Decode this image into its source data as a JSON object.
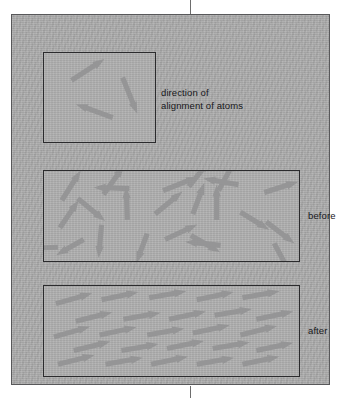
{
  "figure": {
    "panel_background": "#adadad",
    "arrow_color": "#959596",
    "border_color": "#2b2b2d"
  },
  "labels": {
    "key": "direction of\nalignment of atoms",
    "before": "before",
    "after": "after"
  },
  "chart_data": {
    "type": "diagram",
    "panels": [
      {
        "name": "key",
        "label": "direction of\nalignment of atoms",
        "arrow_count": 3,
        "arrows": [
          {
            "x": 28,
            "y": 28,
            "angle": -33,
            "length": 40
          },
          {
            "x": 80,
            "y": 25,
            "angle": 68,
            "length": 40
          },
          {
            "x": 70,
            "y": 66,
            "angle": 200,
            "length": 40
          }
        ]
      },
      {
        "name": "before",
        "label": "before",
        "description": "randomly oriented atomic magnets",
        "arrow_count": 24,
        "arrows": [
          {
            "x": 18,
            "y": 30,
            "angle": -58,
            "length": 36
          },
          {
            "x": 16,
            "y": 58,
            "angle": -56,
            "length": 34
          },
          {
            "x": 34,
            "y": 28,
            "angle": 40,
            "length": 36
          },
          {
            "x": 60,
            "y": 24,
            "angle": -55,
            "length": 36
          },
          {
            "x": 58,
            "y": 55,
            "angle": 95,
            "length": 34
          },
          {
            "x": 86,
            "y": 18,
            "angle": 182,
            "length": 36
          },
          {
            "x": 84,
            "y": 50,
            "angle": -92,
            "length": 34
          },
          {
            "x": 14,
            "y": 78,
            "angle": 178,
            "length": 36
          },
          {
            "x": 112,
            "y": 44,
            "angle": -40,
            "length": 36
          },
          {
            "x": 120,
            "y": 20,
            "angle": -22,
            "length": 38
          },
          {
            "x": 122,
            "y": 70,
            "angle": -25,
            "length": 36
          },
          {
            "x": 146,
            "y": 16,
            "angle": -52,
            "length": 34
          },
          {
            "x": 150,
            "y": 44,
            "angle": -70,
            "length": 34
          },
          {
            "x": 148,
            "y": 66,
            "angle": 30,
            "length": 34
          },
          {
            "x": 176,
            "y": 20,
            "angle": -62,
            "length": 36
          },
          {
            "x": 174,
            "y": 50,
            "angle": -90,
            "length": 36
          },
          {
            "x": 196,
            "y": 14,
            "angle": 190,
            "length": 36
          },
          {
            "x": 198,
            "y": 42,
            "angle": 32,
            "length": 34
          },
          {
            "x": 178,
            "y": 76,
            "angle": 186,
            "length": 36
          },
          {
            "x": 222,
            "y": 22,
            "angle": -18,
            "length": 36
          },
          {
            "x": 224,
            "y": 52,
            "angle": 38,
            "length": 36
          },
          {
            "x": 232,
            "y": 74,
            "angle": 62,
            "length": 34
          },
          {
            "x": 104,
            "y": 64,
            "angle": 110,
            "length": 32
          },
          {
            "x": 40,
            "y": 70,
            "angle": 150,
            "length": 32
          }
        ]
      },
      {
        "name": "after",
        "label": "after",
        "description": "atomic magnets aligned in the same direction",
        "arrow_count": 25,
        "common_angle": -12,
        "arrows": [
          {
            "x": 12,
            "y": 18,
            "angle": -16,
            "length": 38
          },
          {
            "x": 58,
            "y": 14,
            "angle": -12,
            "length": 38
          },
          {
            "x": 106,
            "y": 12,
            "angle": -10,
            "length": 38
          },
          {
            "x": 154,
            "y": 14,
            "angle": -12,
            "length": 38
          },
          {
            "x": 200,
            "y": 12,
            "angle": -10,
            "length": 38
          },
          {
            "x": 32,
            "y": 36,
            "angle": -14,
            "length": 38
          },
          {
            "x": 80,
            "y": 34,
            "angle": -10,
            "length": 38
          },
          {
            "x": 126,
            "y": 34,
            "angle": -12,
            "length": 38
          },
          {
            "x": 172,
            "y": 30,
            "angle": -10,
            "length": 38
          },
          {
            "x": 214,
            "y": 34,
            "angle": -12,
            "length": 38
          },
          {
            "x": 10,
            "y": 52,
            "angle": -16,
            "length": 38
          },
          {
            "x": 56,
            "y": 50,
            "angle": -12,
            "length": 38
          },
          {
            "x": 104,
            "y": 50,
            "angle": -10,
            "length": 38
          },
          {
            "x": 150,
            "y": 48,
            "angle": -12,
            "length": 38
          },
          {
            "x": 198,
            "y": 50,
            "angle": -14,
            "length": 38
          },
          {
            "x": 30,
            "y": 66,
            "angle": -14,
            "length": 38
          },
          {
            "x": 78,
            "y": 66,
            "angle": -10,
            "length": 38
          },
          {
            "x": 124,
            "y": 64,
            "angle": -12,
            "length": 38
          },
          {
            "x": 170,
            "y": 64,
            "angle": -10,
            "length": 38
          },
          {
            "x": 214,
            "y": 66,
            "angle": -12,
            "length": 38
          },
          {
            "x": 14,
            "y": 80,
            "angle": -14,
            "length": 38
          },
          {
            "x": 62,
            "y": 80,
            "angle": -10,
            "length": 38
          },
          {
            "x": 108,
            "y": 80,
            "angle": -12,
            "length": 38
          },
          {
            "x": 154,
            "y": 80,
            "angle": -10,
            "length": 38
          },
          {
            "x": 200,
            "y": 80,
            "angle": -12,
            "length": 38
          }
        ]
      }
    ]
  }
}
